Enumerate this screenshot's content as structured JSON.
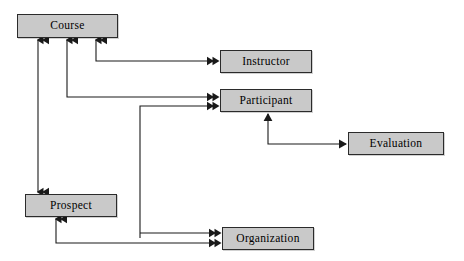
{
  "diagram": {
    "type": "entity-relationship-diagram",
    "background_color": "#ffffff",
    "box_fill_color": "#c9c9c9",
    "box_border_color": "#2b2b2b",
    "line_color": "#1a1a1a",
    "entities": [
      {
        "id": "course",
        "label": "Course",
        "x": 17,
        "y": 14,
        "w": 101,
        "h": 24
      },
      {
        "id": "instructor",
        "label": "Instructor",
        "x": 220,
        "y": 50,
        "w": 92,
        "h": 23
      },
      {
        "id": "participant",
        "label": "Participant",
        "x": 220,
        "y": 89,
        "w": 92,
        "h": 23
      },
      {
        "id": "evaluation",
        "label": "Evaluation",
        "x": 348,
        "y": 132,
        "w": 96,
        "h": 23
      },
      {
        "id": "prospect",
        "label": "Prospect",
        "x": 25,
        "y": 194,
        "w": 92,
        "h": 23
      },
      {
        "id": "organization",
        "label": "Organization",
        "x": 222,
        "y": 227,
        "w": 92,
        "h": 23
      }
    ],
    "relationships": [
      {
        "id": "course-prospect",
        "from": "prospect",
        "to": "course",
        "arrow": "double-chevron-both"
      },
      {
        "id": "instructor-course",
        "from": "instructor",
        "to": "course",
        "arrow": "double-chevron"
      },
      {
        "id": "participant-course",
        "from": "participant",
        "to": "course",
        "arrow": "double-chevron"
      },
      {
        "id": "organization-participant",
        "from": "organization",
        "to": "participant",
        "arrow": "double-chevron"
      },
      {
        "id": "evaluation-participant",
        "from": "evaluation",
        "to": "participant",
        "arrow": "single"
      },
      {
        "id": "organization-prospect",
        "from": "organization",
        "to": "prospect",
        "arrow": "double-chevron"
      }
    ]
  }
}
